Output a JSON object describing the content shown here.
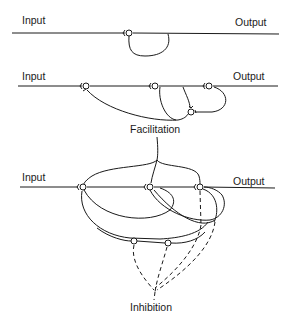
{
  "diagrams": [
    {
      "name": "recurrent-self-loop",
      "input_label": "Input",
      "output_label": "Output"
    },
    {
      "name": "facilitation-network",
      "input_label": "Input",
      "output_label": "Output",
      "caption": "Facilitation"
    },
    {
      "name": "facilitation-inhibition-network",
      "input_label": "Input",
      "output_label": "Output",
      "caption": "Inhibition"
    }
  ],
  "colors": {
    "line": "#1a1a1a",
    "background": "#ffffff"
  }
}
